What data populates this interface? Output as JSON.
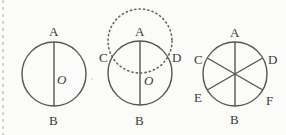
{
  "figure": {
    "colors": {
      "line": "#555555",
      "text": "#3a3a3a",
      "background": "#fbfbf9"
    },
    "panels": [
      {
        "id": "fig1",
        "description": "Circle with vertical diameter AB through center O",
        "labels": {
          "top": "A",
          "bottom": "B",
          "center": "O"
        }
      },
      {
        "id": "fig2",
        "description": "Circle with diameter AB; dotted circle centered at A through O intersects circle at C and D",
        "labels": {
          "top": "A",
          "bottom": "B",
          "center": "O",
          "left": "C",
          "right": "D"
        }
      },
      {
        "id": "fig3",
        "description": "Circle divided into six equal parts by diameters AB, CF, DE",
        "labels": {
          "top": "A",
          "bottom": "B",
          "upper_left": "C",
          "upper_right": "D",
          "lower_left": "E",
          "lower_right": "F"
        }
      }
    ]
  }
}
